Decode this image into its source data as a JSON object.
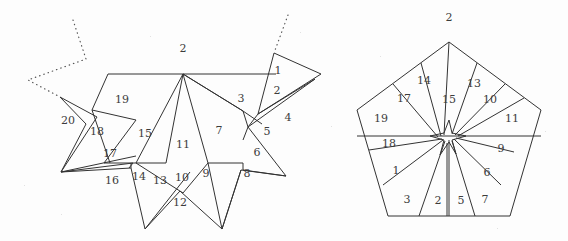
{
  "figure": {
    "background_color": "#fdfdfd",
    "stroke_color": "#333333",
    "label_color": "#3c3c3c",
    "dotted_color": "#555555"
  },
  "left_figure": {
    "name": "star-polygon-dissection",
    "outer_label": {
      "text": "2",
      "x": 183,
      "y": 48
    },
    "cell_labels": [
      {
        "text": "1",
        "x": 278,
        "y": 70
      },
      {
        "text": "2",
        "x": 277,
        "y": 90
      },
      {
        "text": "3",
        "x": 241,
        "y": 98
      },
      {
        "text": "4",
        "x": 288,
        "y": 117
      },
      {
        "text": "5",
        "x": 267,
        "y": 131
      },
      {
        "text": "6",
        "x": 257,
        "y": 152
      },
      {
        "text": "7",
        "x": 219,
        "y": 130
      },
      {
        "text": "8",
        "x": 247,
        "y": 173
      },
      {
        "text": "9",
        "x": 206,
        "y": 173
      },
      {
        "text": "10",
        "x": 182,
        "y": 177
      },
      {
        "text": "11",
        "x": 183,
        "y": 144
      },
      {
        "text": "12",
        "x": 180,
        "y": 202
      },
      {
        "text": "13",
        "x": 160,
        "y": 180
      },
      {
        "text": "14",
        "x": 139,
        "y": 176
      },
      {
        "text": "15",
        "x": 145,
        "y": 133
      },
      {
        "text": "16",
        "x": 112,
        "y": 180
      },
      {
        "text": "17",
        "x": 110,
        "y": 153
      },
      {
        "text": "18",
        "x": 97,
        "y": 131
      },
      {
        "text": "19",
        "x": 122,
        "y": 99
      },
      {
        "text": "20",
        "x": 68,
        "y": 120
      }
    ],
    "dotted_paths": [
      {
        "name": "upper-left-dotted-zigzag",
        "points": "73,20 86,59 28,80 60,97"
      },
      {
        "name": "upper-right-dotted-line",
        "points": "288,15 274,53"
      }
    ]
  },
  "right_figure": {
    "name": "pentagon-dissection",
    "outer_label": {
      "text": "2",
      "x": 449,
      "y": 17
    },
    "cell_labels": [
      {
        "text": "1",
        "x": 396,
        "y": 170
      },
      {
        "text": "2",
        "x": 438,
        "y": 200
      },
      {
        "text": "3",
        "x": 407,
        "y": 199
      },
      {
        "text": "5",
        "x": 461,
        "y": 200
      },
      {
        "text": "6",
        "x": 487,
        "y": 172
      },
      {
        "text": "7",
        "x": 485,
        "y": 199
      },
      {
        "text": "9",
        "x": 501,
        "y": 148
      },
      {
        "text": "10",
        "x": 490,
        "y": 99
      },
      {
        "text": "11",
        "x": 512,
        "y": 118
      },
      {
        "text": "13",
        "x": 474,
        "y": 83
      },
      {
        "text": "14",
        "x": 424,
        "y": 80
      },
      {
        "text": "15",
        "x": 449,
        "y": 99
      },
      {
        "text": "17",
        "x": 404,
        "y": 98
      },
      {
        "text": "18",
        "x": 389,
        "y": 143
      },
      {
        "text": "19",
        "x": 381,
        "y": 118
      }
    ],
    "pentagon_vertices": "449,42 541,110 510,216 388,216 357,110"
  },
  "paper_specks": [
    {
      "x": 24,
      "y": 185
    },
    {
      "x": 61,
      "y": 214
    },
    {
      "x": 300,
      "y": 32
    },
    {
      "x": 331,
      "y": 126
    },
    {
      "x": 545,
      "y": 131
    },
    {
      "x": 380,
      "y": 56
    },
    {
      "x": 497,
      "y": 228
    },
    {
      "x": 150,
      "y": 36
    }
  ]
}
